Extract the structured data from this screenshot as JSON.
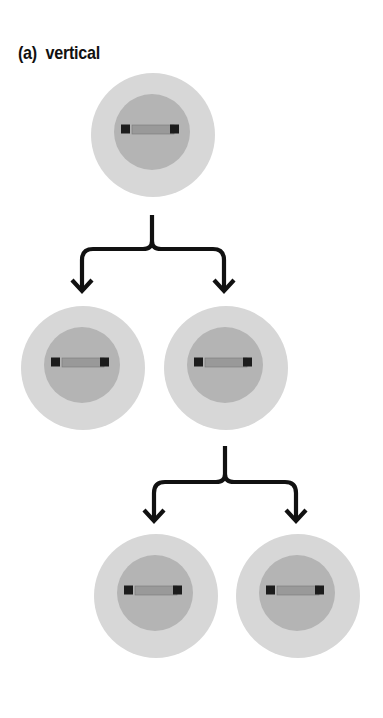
{
  "title": "(a)  vertical",
  "colors": {
    "outer_circle": "#d7d7d7",
    "inner_circle": "#b4b4b4",
    "bar": "#999999",
    "bar_ends": "#1c1c1c",
    "arrow": "#111111"
  },
  "cells": [
    {
      "id": "parent",
      "cx": 153,
      "cy": 135
    },
    {
      "id": "daughter-left",
      "cx": 83,
      "cy": 368
    },
    {
      "id": "daughter-right",
      "cx": 226,
      "cy": 368
    },
    {
      "id": "granddaughter-left",
      "cx": 156,
      "cy": 596
    },
    {
      "id": "granddaughter-right",
      "cx": 298,
      "cy": 596
    }
  ],
  "divisions": [
    {
      "from": "parent",
      "stem_x": 152,
      "stem_top": 215,
      "bar_y": 249,
      "left_x": 82,
      "right_x": 224,
      "tip_y": 292
    },
    {
      "from": "daughter-right",
      "stem_x": 225,
      "stem_top": 446,
      "bar_y": 482,
      "left_x": 154,
      "right_x": 296,
      "tip_y": 522
    }
  ]
}
